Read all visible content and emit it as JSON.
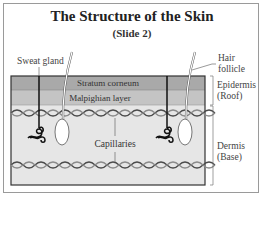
{
  "diagram": {
    "title": "The Structure of the Skin",
    "subtitle": "(Slide 2)",
    "labels": {
      "sweat_gland": "Sweat gland",
      "hair_follicle_line1": "Hair",
      "hair_follicle_line2": "follicle",
      "stratum_corneum": "Stratum corneum",
      "malpighian_layer": "Malpighian layer",
      "capillaries": "Capillaries",
      "epidermis_line1": "Epidermis",
      "epidermis_line2": "(Roof)",
      "dermis_line1": "Dermis",
      "dermis_line2": "(Base)"
    },
    "colors": {
      "stratum_corneum": "#a9a9a9",
      "malpighian_layer": "#c4c4c4",
      "dermis": "#e6e6e6",
      "capillary_dark": "#4a4a4a",
      "capillary_light": "#8a8a8a",
      "frame": "#9a9a9a"
    }
  }
}
